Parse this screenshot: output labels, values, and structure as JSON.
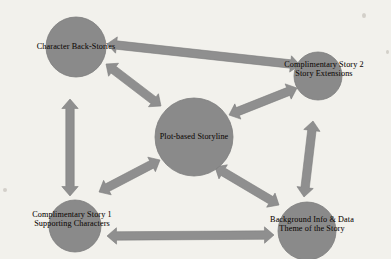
{
  "diagram": {
    "background_color": "#f2f1ec",
    "node_fill_color": "#8a8a8a",
    "arrow_color": "#8f8f8f",
    "text_color": "#15100d",
    "nodes": [
      {
        "id": "character-back-stories",
        "label": "Character Back-Stories",
        "label_lines": [
          "Character Back-Stories"
        ],
        "cx": 76,
        "cy": 47,
        "r": 30,
        "label_x": 76,
        "label_y": 47,
        "font_size": 8.2
      },
      {
        "id": "complimentary-story-2",
        "label": "Complimentary Story 2 Story Extensions",
        "label_lines": [
          "Complimentary Story 2",
          "Story Extensions"
        ],
        "cx": 318,
        "cy": 76,
        "r": 24,
        "label_x": 324,
        "label_y": 70,
        "font_size": 8.2
      },
      {
        "id": "plot-based-storyline",
        "label": "Plot-based Storyline",
        "label_lines": [
          "Plot-based Storyline"
        ],
        "cx": 194,
        "cy": 137,
        "r": 39,
        "label_x": 194,
        "label_y": 137,
        "font_size": 8.2
      },
      {
        "id": "complimentary-story-1",
        "label": "Complimentary Story 1 Supporting Characters",
        "label_lines": [
          "Complimentary Story 1",
          "Supporting Characters"
        ],
        "cx": 75,
        "cy": 226,
        "r": 26,
        "label_x": 72,
        "label_y": 220,
        "font_size": 8.2
      },
      {
        "id": "background-info-data",
        "label": "Background Info & Data Theme of the Story",
        "label_lines": [
          "Background Info & Data",
          "Theme of the Story"
        ],
        "cx": 307,
        "cy": 231,
        "r": 29,
        "label_x": 312,
        "label_y": 225,
        "font_size": 8.2
      }
    ],
    "edges": [
      {
        "id": "edge-backstories-story2",
        "from": "character-back-stories",
        "to": "complimentary-story-2",
        "x1": 107,
        "y1": 44,
        "x2": 300,
        "y2": 65,
        "double_headed": true
      },
      {
        "id": "edge-backstories-plot",
        "from": "character-back-stories",
        "to": "plot-based-storyline",
        "x1": 106,
        "y1": 64,
        "x2": 161,
        "y2": 106,
        "double_headed": true
      },
      {
        "id": "edge-backstories-story1",
        "from": "character-back-stories",
        "to": "complimentary-story-1",
        "x1": 70,
        "y1": 99,
        "x2": 70,
        "y2": 196,
        "double_headed": true
      },
      {
        "id": "edge-plot-story2",
        "from": "plot-based-storyline",
        "to": "complimentary-story-2",
        "x1": 229,
        "y1": 115,
        "x2": 297,
        "y2": 88,
        "double_headed": true
      },
      {
        "id": "edge-plot-story1",
        "from": "plot-based-storyline",
        "to": "complimentary-story-1",
        "x1": 160,
        "y1": 160,
        "x2": 99,
        "y2": 192,
        "double_headed": true
      },
      {
        "id": "edge-plot-background",
        "from": "plot-based-storyline",
        "to": "background-info-data",
        "x1": 215,
        "y1": 167,
        "x2": 279,
        "y2": 205,
        "double_headed": true
      },
      {
        "id": "edge-story2-background",
        "from": "complimentary-story-2",
        "to": "background-info-data",
        "x1": 313,
        "y1": 121,
        "x2": 304,
        "y2": 197,
        "double_headed": true
      },
      {
        "id": "edge-story1-background",
        "from": "complimentary-story-1",
        "to": "background-info-data",
        "x1": 107,
        "y1": 236,
        "x2": 274,
        "y2": 235,
        "double_headed": true
      }
    ]
  }
}
